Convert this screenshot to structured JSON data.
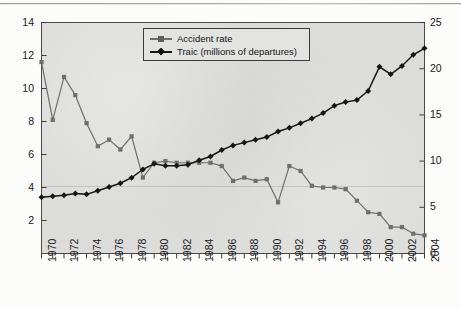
{
  "figure": {
    "background_color": "#fcfcfb",
    "plot_background_color": "#dcdcda",
    "frame_color": "#4a4a4a"
  },
  "legend": {
    "position": "top-center",
    "entries": [
      {
        "label": "Accident rate",
        "marker": "square",
        "color": "#6e6e6e"
      },
      {
        "label": "Traic (millions of departures)",
        "marker": "diamond",
        "color": "#161616"
      }
    ]
  },
  "axes": {
    "left": {
      "ticks": [
        "2",
        "4",
        "6",
        "8",
        "10",
        "12",
        "14"
      ],
      "min": 0,
      "max": 14
    },
    "right": {
      "ticks": [
        "0",
        "5",
        "10",
        "15",
        "20",
        "25"
      ],
      "min": 0,
      "max": 25
    },
    "bottom": {
      "ticks": [
        "1970",
        "1972",
        "1974",
        "1976",
        "1978",
        "1980",
        "1982",
        "1984",
        "1986",
        "1988",
        "1990",
        "1992",
        "1994",
        "1996",
        "1998",
        "2000",
        "2002",
        "2004"
      ]
    }
  },
  "chart_data": {
    "type": "line",
    "title": "",
    "xlabel": "",
    "ylabel": "",
    "grid": false,
    "legend_position": "top-center",
    "x": [
      1970,
      1971,
      1972,
      1973,
      1974,
      1975,
      1976,
      1977,
      1978,
      1979,
      1980,
      1981,
      1982,
      1983,
      1984,
      1985,
      1986,
      1987,
      1988,
      1989,
      1990,
      1991,
      1992,
      1993,
      1994,
      1995,
      1996,
      1997,
      1998,
      1999,
      2000,
      2001,
      2002,
      2003,
      2004
    ],
    "series": [
      {
        "name": "Accident rate",
        "axis": "left",
        "color": "#6e6e6e",
        "marker": "square",
        "ylim": [
          0,
          14
        ],
        "values": [
          11.6,
          8.1,
          10.7,
          9.6,
          7.9,
          6.5,
          6.9,
          6.3,
          7.1,
          4.6,
          5.5,
          5.6,
          5.5,
          5.5,
          5.5,
          5.5,
          5.3,
          4.4,
          4.6,
          4.4,
          4.5,
          3.1,
          5.3,
          5.0,
          4.1,
          4.0,
          4.0,
          3.9,
          3.2,
          2.5,
          2.4,
          1.6,
          1.6,
          1.2,
          1.1
        ]
      },
      {
        "name": "Traic (millions of departures)",
        "axis": "right",
        "color": "#161616",
        "marker": "diamond",
        "ylim": [
          0,
          25
        ],
        "values": [
          6.1,
          6.2,
          6.3,
          6.5,
          6.4,
          6.8,
          7.2,
          7.6,
          8.2,
          9.1,
          9.7,
          9.5,
          9.5,
          9.6,
          10.1,
          10.5,
          11.2,
          11.7,
          12.0,
          12.3,
          12.6,
          13.2,
          13.6,
          14.1,
          14.6,
          15.2,
          16.0,
          16.4,
          16.6,
          17.6,
          20.2,
          19.4,
          20.3,
          21.5,
          22.2
        ]
      }
    ]
  }
}
